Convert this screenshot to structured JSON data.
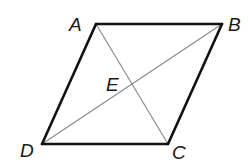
{
  "diagram": {
    "type": "parallelogram-with-diagonals",
    "colors": {
      "edge": "#111111",
      "diagonal": "#8a8a8a",
      "label": "#1a1a1a",
      "background": "#ffffff"
    },
    "vertices": {
      "A": {
        "label": "A",
        "x": 96,
        "y": 24
      },
      "B": {
        "label": "B",
        "x": 222,
        "y": 24
      },
      "C": {
        "label": "C",
        "x": 168,
        "y": 144
      },
      "D": {
        "label": "D",
        "x": 42,
        "y": 144
      },
      "E": {
        "label": "E",
        "x": 132,
        "y": 84
      }
    },
    "edges": [
      {
        "from": "A",
        "to": "B"
      },
      {
        "from": "B",
        "to": "C"
      },
      {
        "from": "C",
        "to": "D"
      },
      {
        "from": "D",
        "to": "A"
      }
    ],
    "diagonals": [
      {
        "from": "A",
        "to": "C"
      },
      {
        "from": "D",
        "to": "B"
      }
    ],
    "labels": {
      "A": "A",
      "B": "B",
      "C": "C",
      "D": "D",
      "E": "E"
    }
  }
}
